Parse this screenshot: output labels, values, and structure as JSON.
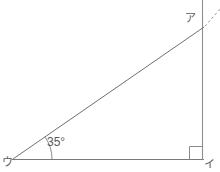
{
  "figure": {
    "type": "geometry-diagram",
    "canvas": {
      "width": 220,
      "height": 172
    },
    "stroke_color": "#7a7a7a",
    "dashed_color": "#8a8a8a",
    "text_color": "#5a5a5a",
    "background": "#ffffff",
    "labels": {
      "vertex_top_right": "ア",
      "vertex_bottom_right": "イ",
      "vertex_bottom_left": "ウ",
      "angle_at_u": "35°"
    },
    "points": {
      "a": {
        "x": 203,
        "y": 28
      },
      "i": {
        "x": 203,
        "y": 159
      },
      "u": {
        "x": 14,
        "y": 159
      }
    },
    "segments": [
      {
        "name": "hypotenuse-u-to-a",
        "x1": 14,
        "y1": 159,
        "x2": 203,
        "y2": 28,
        "style": "solid"
      },
      {
        "name": "vertical-side-a-to-i",
        "x1": 203,
        "y1": 0,
        "x2": 203,
        "y2": 160,
        "style": "solid"
      },
      {
        "name": "base-u-to-i",
        "x1": 12,
        "y1": 159,
        "x2": 204,
        "y2": 159,
        "style": "solid"
      },
      {
        "name": "dashed-extension-beyond-a",
        "x1": 205,
        "y1": 26,
        "x2": 220,
        "y2": 9,
        "style": "dashed"
      }
    ],
    "right_angle_marker": {
      "name": "right-angle-at-i",
      "x": 189,
      "y": 146,
      "size": 13
    },
    "angle_arc": {
      "name": "angle-arc-at-u",
      "center_x": 14,
      "center_y": 159,
      "radius": 38,
      "degrees": 35
    }
  }
}
